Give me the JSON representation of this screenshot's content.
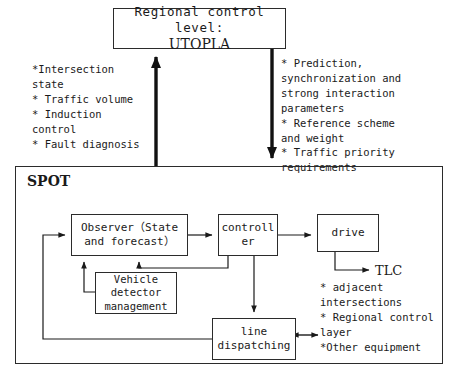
{
  "diagram": {
    "title_box": {
      "line1": "Regional control level:",
      "line2": "UTOPLA"
    },
    "container": {
      "label": "SPOT"
    },
    "upward_notes": "*Intersection\nstate\n * Traffic volume\n * Induction\ncontrol\n * Fault diagnosis",
    "downward_notes": "* Prediction,\nsynchronization and\nstrong interaction\nparameters\n * Reference scheme\nand weight\n* Traffic priority\nrequirements",
    "blocks": {
      "observer": "Observer（State\nand forecast）",
      "controller": "controll\ner",
      "drive": "drive",
      "vehicle_detector": "Vehicle\ndetector\nmanagement",
      "line_dispatching": "line\ndispatching"
    },
    "output": {
      "label": "TLC",
      "notes": "* adjacent\nintersections\n* Regional control\nlayer\n*Other equipment"
    },
    "colors": {
      "stroke": "#2b2b2b",
      "text": "#1a1a1a",
      "background": "#ffffff"
    }
  }
}
